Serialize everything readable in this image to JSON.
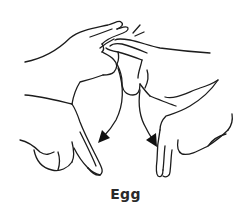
{
  "illustration": {
    "subject": "sign-language-gesture",
    "description": "Two hands, extended index and middle fingers tapping together, then moving downward and apart",
    "line_color": "#1c1c1c",
    "arrows": [
      {
        "name": "left-arrow",
        "direction": "down-left"
      },
      {
        "name": "right-arrow",
        "direction": "down-right"
      }
    ]
  },
  "caption": {
    "text": "Egg",
    "color": "#2a2a2a"
  }
}
